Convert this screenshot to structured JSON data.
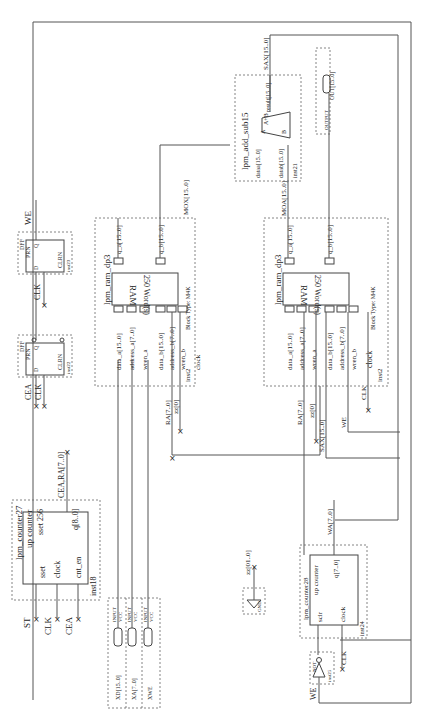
{
  "diagram": {
    "orientation": "rotated-90-ccw",
    "counter27": {
      "name": "lpm_counter27",
      "type": "up counter",
      "param": "sset 256",
      "ports_in": [
        "sset",
        "clock",
        "cnt_en"
      ],
      "port_out": "q[8..0]",
      "inst": "inst18",
      "inputs": [
        "ST",
        "CLK",
        "CEA"
      ],
      "output_net": "CEA,RA[7..0]"
    },
    "inputs_block": {
      "pins": [
        {
          "type": "INPUT",
          "val": "VCC",
          "name": "XD[15..0]"
        },
        {
          "type": "INPUT",
          "val": "VCC",
          "name": "XA[7..0]"
        },
        {
          "type": "INPUT",
          "val": "VCC",
          "name": "XWE"
        }
      ]
    },
    "dff_top": {
      "type": "DFF",
      "pins": [
        "PRN",
        "D",
        "Q",
        "CLRN"
      ],
      "inst": "inst23",
      "clock": "CLK",
      "output_net": "WE"
    },
    "dff_bottom": {
      "type": "DFF",
      "pins": [
        "PRN",
        "D",
        "Q",
        "CLRN"
      ],
      "inst": "inst22",
      "inputs": [
        "CEA",
        "CLK"
      ]
    },
    "ram_left": {
      "name": "lpm_ram_dp3",
      "core": "RAM",
      "words": "250 Word(s)",
      "ports": [
        "data_a[15..0]",
        "address_a[7..0]",
        "wren_a",
        "data_b[15..0]",
        "address_b[7..0]",
        "wren_b",
        "clock"
      ],
      "outputs": [
        "q_a[15..0]",
        "q_b[15..0]"
      ],
      "block_type": "Block Type: M4K",
      "inst": "inst2",
      "nets": [
        "RA[7..0]",
        "zz[0]",
        "MOX[15..0]"
      ]
    },
    "ram_right": {
      "name": "lpm_ram_dp3",
      "core": "RAM",
      "words": "250 Word(s)",
      "ports": [
        "data_a[15..0]",
        "address_a[7..0]",
        "wren_a",
        "data_b[15..0]",
        "address_b[7..0]",
        "wren_b",
        "clock"
      ],
      "outputs": [
        "q_a[15..0]",
        "q_b[15..0]"
      ],
      "block_type": "Block Type: M4K",
      "inst": "inst2",
      "nets": [
        "RA[7..0]",
        "zz[0]",
        "SAX[15..0]",
        "WE",
        "CLK",
        "MOA[15..0]"
      ]
    },
    "addsub": {
      "name": "lpm_add_sub15",
      "ports_in": [
        "dataa[15..0]",
        "datab[15..0]"
      ],
      "port_out": "result[15..0]",
      "op": "A+B",
      "a": "A",
      "b": "B",
      "inst": "inst21",
      "output_net": "SAX[15..0]"
    },
    "output_pin": {
      "type": "OUTPUT",
      "name": "OUT[15..0]"
    },
    "gnd": {
      "label": "GND",
      "net": "zz[01..0]"
    },
    "counter28": {
      "name": "lpm_counter28",
      "type": "up counter",
      "ports_in": [
        "sclr",
        "clock"
      ],
      "port_out": "q[7..0]",
      "inst": "inst24",
      "output_net": "WA[7..0]",
      "clock": "CLK"
    },
    "not_gate": {
      "type": "NOT",
      "inst": "inst25",
      "input": "WE"
    }
  }
}
